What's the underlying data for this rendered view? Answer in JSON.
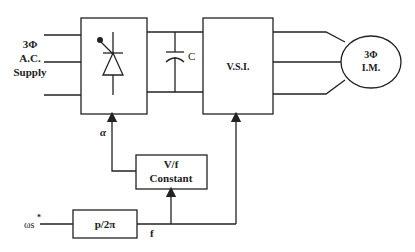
{
  "diagram": {
    "type": "block-diagram",
    "supply": {
      "line1": "3Φ",
      "line2": "A.C.",
      "line3": "Supply"
    },
    "rectifier": {
      "symbol": "thyristor-icon"
    },
    "dc_link": {
      "capacitor_label": "C"
    },
    "inverter": {
      "label": "V.S.I."
    },
    "motor": {
      "line1": "3Φ",
      "line2": "I.M."
    },
    "vf_block": {
      "line1": "V/f",
      "line2": "Constant"
    },
    "gain_block": {
      "label": "p/2π"
    },
    "signals": {
      "input": "ωs",
      "input_superscript": "*",
      "alpha": "α",
      "frequency": "f"
    },
    "colors": {
      "line": "#222222",
      "background": "#ffffff"
    }
  }
}
